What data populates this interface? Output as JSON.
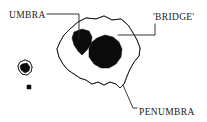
{
  "figure": {
    "width": 207,
    "height": 122,
    "background_color": "#ffffff",
    "ink_color": "#1a1a1a",
    "umbra_fill_color": "#0b0b0b",
    "penumbra_texture": "stipple",
    "caption": ""
  },
  "labels": [
    {
      "id": "umbra",
      "text": "UMBRA",
      "x": 9,
      "y": 18,
      "anchor": "start",
      "leader": "M 47 14 L 79 14 L 79 40"
    },
    {
      "id": "bridge",
      "text": "'BRIDGE'",
      "x": 153,
      "y": 20,
      "anchor": "start",
      "leader": "M 155 24 L 155 35 L 118 35"
    },
    {
      "id": "penumbra",
      "text": "PENUMBRA",
      "x": 139,
      "y": 115,
      "anchor": "start",
      "leader": "M 123 85 L 133 108 L 137 108"
    }
  ],
  "shapes": {
    "main_spot": {
      "name": "main-sunspot",
      "penumbra_outline": "M 78 22 L 86 18 L 96 19 L 104 16 L 112 20 L 121 19 L 128 25 L 133 33 L 137 40 L 140 48 L 139 56 L 134 62 L 130 69 L 127 76 L 124 84 L 120 88 L 116 84 L 110 82 L 104 85 L 98 82 L 92 84 L 86 80 L 80 78 L 74 74 L 68 70 L 63 64 L 59 57 L 57 49 L 60 42 L 64 35 L 70 29 Z",
      "umbra_regions": [
        {
          "name": "umbra-upper-left",
          "path": "M 74 32 L 82 29 L 89 31 L 92 37 L 91 44 L 87 50 L 82 55 L 78 51 L 74 45 L 72 38 Z"
        },
        {
          "name": "umbra-lower-right",
          "path": "M 97 38 L 105 35 L 113 37 L 119 42 L 122 49 L 121 57 L 116 64 L 109 68 L 101 68 L 94 64 L 89 57 L 89 48 L 92 42 Z"
        }
      ],
      "bridge_note": "light lane separating the two umbral cores"
    },
    "secondary_spot": {
      "name": "secondary-sunspot",
      "penumbra_outline": "M 20 62 L 25 60 L 30 62 L 32 67 L 31 72 L 27 75 L 22 74 L 19 70 L 18 66 Z",
      "umbra_path": "M 22 64 L 27 63 L 30 67 L 29 71 L 25 73 L 21 70 L 20 66 Z"
    },
    "pore": {
      "name": "pore-spot",
      "path": "M 27 85 L 31 85 L 31 89 L 27 89 Z"
    }
  }
}
